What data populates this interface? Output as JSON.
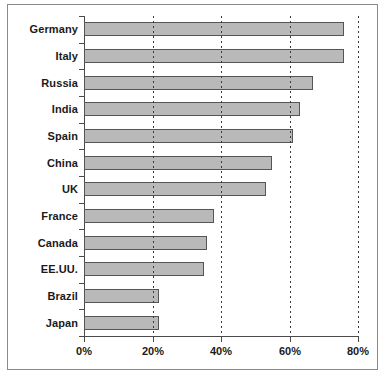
{
  "chart_data": {
    "type": "bar",
    "orientation": "horizontal",
    "title": "",
    "subtitle": "",
    "xlabel": "",
    "ylabel": "",
    "categories": [
      "Germany",
      "Italy",
      "Russia",
      "India",
      "Spain",
      "China",
      "UK",
      "France",
      "Canada",
      "EE.UU.",
      "Brazil",
      "Japan"
    ],
    "values": [
      76,
      76,
      67,
      63,
      61,
      55,
      53,
      38,
      36,
      35,
      22,
      22
    ],
    "value_unit": "%",
    "xlim": [
      0,
      80
    ],
    "xticks": [
      0,
      20,
      40,
      60,
      80
    ],
    "xtick_labels": [
      "0%",
      "20%",
      "40%",
      "60%",
      "80%"
    ],
    "grid": {
      "vertical": true,
      "horizontal": false,
      "style": "dashed"
    },
    "legend": {
      "visible": false,
      "position": "none"
    },
    "series": [
      {
        "name": "",
        "values": [
          76,
          76,
          67,
          63,
          61,
          55,
          53,
          38,
          36,
          35,
          22,
          22
        ]
      }
    ],
    "colors": {
      "bar_fill": "#b9b9b9",
      "bar_border": "#555555",
      "axis": "#4a4a4a",
      "gridline": "#3a3a3a",
      "frame": "#8a8a8a",
      "text": "#1a1a1a",
      "background": "#ffffff"
    }
  }
}
